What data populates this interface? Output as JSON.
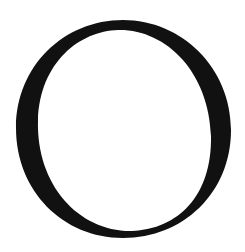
{
  "glyph": {
    "character": "O",
    "color": "#111111",
    "background": "#ffffff"
  }
}
